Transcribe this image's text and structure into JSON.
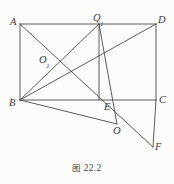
{
  "figure": {
    "caption_prefix": "图",
    "caption_number": "22.2",
    "caption_full": "图 22.2",
    "background_color": "#fbfbfa",
    "stroke_color": "#4a4a46",
    "label_color": "#3a3a38"
  },
  "points": [
    {
      "id": "A",
      "label": "A",
      "sub": "",
      "x": 20,
      "y": 24,
      "label_x": 10,
      "label_y": 17
    },
    {
      "id": "Q1",
      "label": "Q",
      "sub": "1",
      "x": 99,
      "y": 24,
      "label_x": 93,
      "label_y": 13
    },
    {
      "id": "D",
      "label": "D",
      "sub": "",
      "x": 156,
      "y": 24,
      "label_x": 158,
      "label_y": 15
    },
    {
      "id": "O1",
      "label": "O",
      "sub": "1",
      "x": 52,
      "y": 62,
      "label_x": 39,
      "label_y": 55
    },
    {
      "id": "B",
      "label": "B",
      "sub": "",
      "x": 20,
      "y": 100,
      "label_x": 9,
      "label_y": 98
    },
    {
      "id": "E",
      "label": "E",
      "sub": "",
      "x": 99,
      "y": 100,
      "label_x": 104,
      "label_y": 102
    },
    {
      "id": "C",
      "label": "C",
      "sub": "",
      "x": 156,
      "y": 100,
      "label_x": 159,
      "label_y": 95
    },
    {
      "id": "O",
      "label": "O",
      "sub": "",
      "x": 117,
      "y": 124,
      "label_x": 113,
      "label_y": 126
    },
    {
      "id": "F",
      "label": "F",
      "sub": "",
      "x": 153,
      "y": 147,
      "label_x": 155,
      "label_y": 142
    }
  ],
  "segments": [
    {
      "name": "segment-A-D",
      "from": "A",
      "to": "D",
      "x1": 20,
      "y1": 24,
      "x2": 156,
      "y2": 24
    },
    {
      "name": "segment-A-B",
      "from": "A",
      "to": "B",
      "x1": 20,
      "y1": 24,
      "x2": 20,
      "y2": 100
    },
    {
      "name": "segment-B-C",
      "from": "B",
      "to": "C",
      "x1": 20,
      "y1": 100,
      "x2": 156,
      "y2": 100
    },
    {
      "name": "segment-D-C",
      "from": "D",
      "to": "C",
      "x1": 156,
      "y1": 24,
      "x2": 156,
      "y2": 100
    },
    {
      "name": "segment-Q1-E",
      "from": "Q1",
      "to": "E",
      "x1": 99,
      "y1": 24,
      "x2": 99,
      "y2": 100
    },
    {
      "name": "segment-B-Q1",
      "from": "B",
      "to": "Q1",
      "x1": 20,
      "y1": 100,
      "x2": 99,
      "y2": 24
    },
    {
      "name": "segment-B-D",
      "from": "B",
      "to": "D",
      "x1": 20,
      "y1": 100,
      "x2": 156,
      "y2": 24
    },
    {
      "name": "segment-A-F",
      "from": "A",
      "to": "F",
      "x1": 20,
      "y1": 24,
      "x2": 153,
      "y2": 147
    },
    {
      "name": "segment-B-O",
      "from": "B",
      "to": "O",
      "x1": 20,
      "y1": 100,
      "x2": 117,
      "y2": 124
    },
    {
      "name": "segment-C-F",
      "from": "C",
      "to": "F",
      "x1": 156,
      "y1": 100,
      "x2": 153,
      "y2": 147
    },
    {
      "name": "segment-Q1-O",
      "from": "Q1",
      "to": "O",
      "x1": 99,
      "y1": 24,
      "x2": 117,
      "y2": 124
    }
  ]
}
